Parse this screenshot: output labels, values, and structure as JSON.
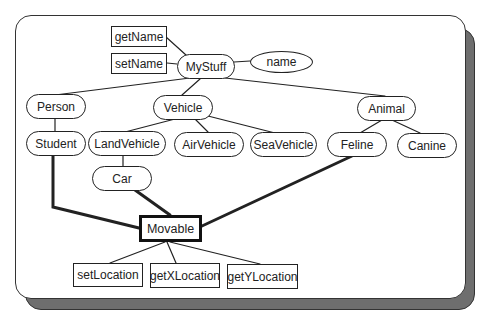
{
  "diagram": {
    "title": "",
    "nodes": [
      {
        "id": "getName",
        "label": "getName",
        "shape": "rect",
        "x": 111,
        "y": 26,
        "w": 56,
        "h": 21
      },
      {
        "id": "setName",
        "label": "setName",
        "shape": "rect",
        "x": 111,
        "y": 53,
        "w": 56,
        "h": 21
      },
      {
        "id": "MyStuff",
        "label": "MyStuff",
        "shape": "oval",
        "x": 177,
        "y": 54,
        "w": 58,
        "h": 25
      },
      {
        "id": "name",
        "label": "name",
        "shape": "ellipse",
        "x": 250,
        "y": 51,
        "w": 63,
        "h": 22
      },
      {
        "id": "Person",
        "label": "Person",
        "shape": "oval",
        "x": 26,
        "y": 94,
        "w": 60,
        "h": 25
      },
      {
        "id": "Vehicle",
        "label": "Vehicle",
        "shape": "oval",
        "x": 153,
        "y": 95,
        "w": 60,
        "h": 25
      },
      {
        "id": "Animal",
        "label": "Animal",
        "shape": "oval",
        "x": 357,
        "y": 96,
        "w": 59,
        "h": 25
      },
      {
        "id": "Student",
        "label": "Student",
        "shape": "oval",
        "x": 26,
        "y": 131,
        "w": 60,
        "h": 25
      },
      {
        "id": "LandVehicle",
        "label": "LandVehicle",
        "shape": "oval",
        "x": 88,
        "y": 131,
        "w": 78,
        "h": 25
      },
      {
        "id": "AirVehicle",
        "label": "AirVehicle",
        "shape": "oval",
        "x": 174,
        "y": 132,
        "w": 70,
        "h": 25
      },
      {
        "id": "SeaVehicle",
        "label": "SeaVehicle",
        "shape": "oval",
        "x": 250,
        "y": 132,
        "w": 67,
        "h": 25
      },
      {
        "id": "Feline",
        "label": "Feline",
        "shape": "oval",
        "x": 327,
        "y": 132,
        "w": 60,
        "h": 25
      },
      {
        "id": "Canine",
        "label": "Canine",
        "shape": "oval",
        "x": 397,
        "y": 133,
        "w": 60,
        "h": 25
      },
      {
        "id": "Car",
        "label": "Car",
        "shape": "oval",
        "x": 92,
        "y": 166,
        "w": 60,
        "h": 25
      },
      {
        "id": "Movable",
        "label": "Movable",
        "shape": "thick",
        "x": 139,
        "y": 215,
        "w": 63,
        "h": 27
      },
      {
        "id": "setLocation",
        "label": "setLocation",
        "shape": "rect",
        "x": 73,
        "y": 263,
        "w": 70,
        "h": 24
      },
      {
        "id": "getXLocation",
        "label": "getXLocation",
        "shape": "rect",
        "x": 150,
        "y": 263,
        "w": 70,
        "h": 25
      },
      {
        "id": "getYLocation",
        "label": "getYLocation",
        "shape": "rect",
        "x": 227,
        "y": 264,
        "w": 71,
        "h": 25
      }
    ],
    "edges": [
      {
        "from": "getName",
        "to": "MyStuff",
        "style": "thin"
      },
      {
        "from": "setName",
        "to": "MyStuff",
        "style": "thin"
      },
      {
        "from": "MyStuff",
        "to": "name",
        "style": "thin"
      },
      {
        "from": "MyStuff",
        "to": "Person",
        "style": "thin"
      },
      {
        "from": "MyStuff",
        "to": "Vehicle",
        "style": "thin"
      },
      {
        "from": "MyStuff",
        "to": "Animal",
        "style": "thin"
      },
      {
        "from": "Person",
        "to": "Student",
        "style": "thin"
      },
      {
        "from": "Vehicle",
        "to": "LandVehicle",
        "style": "thin"
      },
      {
        "from": "Vehicle",
        "to": "AirVehicle",
        "style": "thin"
      },
      {
        "from": "Vehicle",
        "to": "SeaVehicle",
        "style": "thin"
      },
      {
        "from": "Animal",
        "to": "Feline",
        "style": "thin"
      },
      {
        "from": "Animal",
        "to": "Canine",
        "style": "thin"
      },
      {
        "from": "LandVehicle",
        "to": "Car",
        "style": "thin"
      },
      {
        "from": "Student",
        "to": "Movable",
        "style": "thick"
      },
      {
        "from": "Car",
        "to": "Movable",
        "style": "thick"
      },
      {
        "from": "Feline",
        "to": "Movable",
        "style": "thick"
      },
      {
        "from": "Movable",
        "to": "setLocation",
        "style": "thin"
      },
      {
        "from": "Movable",
        "to": "getXLocation",
        "style": "thin"
      },
      {
        "from": "Movable",
        "to": "getYLocation",
        "style": "thin"
      }
    ]
  }
}
